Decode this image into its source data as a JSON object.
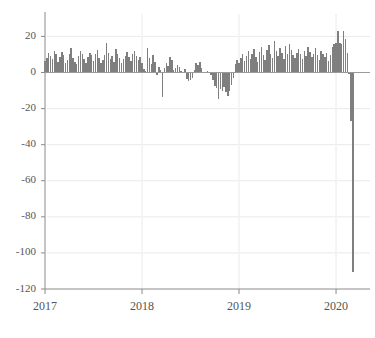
{
  "chart_data": {
    "type": "bar",
    "title": "",
    "subtitle": "",
    "xlabel": "",
    "ylabel": "",
    "xlim": [
      2017.0,
      2020.35
    ],
    "ylim": [
      -120,
      28
    ],
    "grid": true,
    "legend": null,
    "bar_color": "#7f7f7f",
    "x_tick_labels": [
      "2017",
      "2018",
      "2019",
      "2020"
    ],
    "x_tick_values": [
      2017,
      2018,
      2019,
      2020
    ],
    "y_tick_labels": [
      "20",
      "0",
      "-20",
      "-40",
      "-60",
      "-80",
      "-100",
      "-120"
    ],
    "y_tick_values": [
      20,
      0,
      -20,
      -40,
      -60,
      -80,
      -100,
      -120
    ],
    "x_start": 2017.0,
    "x_step": 0.019230769,
    "values": [
      6.5,
      8.0,
      11.0,
      9.0,
      7.5,
      12.0,
      10.0,
      6.0,
      8.5,
      11.5,
      9.5,
      5.5,
      7.0,
      10.5,
      13.5,
      8.0,
      6.0,
      4.5,
      9.0,
      12.0,
      10.0,
      7.5,
      5.0,
      8.5,
      11.0,
      9.5,
      6.5,
      10.0,
      12.5,
      8.0,
      5.5,
      7.0,
      9.5,
      16.5,
      11.0,
      7.5,
      9.0,
      6.0,
      13.0,
      10.5,
      8.0,
      5.5,
      7.5,
      9.0,
      11.5,
      8.5,
      6.5,
      10.0,
      12.0,
      9.0,
      7.0,
      8.5,
      5.0,
      2.0,
      0.8,
      13.5,
      8.0,
      4.5,
      9.5,
      6.0,
      -1.5,
      3.0,
      1.5,
      -13.5,
      2.5,
      5.0,
      3.5,
      8.5,
      7.0,
      1.5,
      2.5,
      4.0,
      3.0,
      1.0,
      -0.5,
      2.0,
      -3.5,
      -4.5,
      -4.0,
      -3.0,
      1.5,
      5.5,
      4.0,
      6.0,
      2.5,
      0.5,
      -0.5,
      1.0,
      0.5,
      -1.5,
      -4.0,
      -7.5,
      -8.5,
      -14.5,
      -9.0,
      -10.5,
      -8.0,
      -11.0,
      -13.0,
      -10.0,
      -7.0,
      -3.0,
      4.5,
      7.0,
      5.5,
      8.0,
      10.5,
      6.5,
      9.0,
      12.0,
      7.5,
      10.0,
      13.0,
      8.5,
      6.0,
      11.5,
      14.0,
      9.5,
      7.0,
      12.5,
      15.0,
      10.0,
      8.0,
      17.5,
      12.0,
      9.0,
      13.5,
      11.0,
      7.5,
      14.5,
      10.5,
      16.0,
      12.5,
      9.5,
      8.0,
      11.0,
      13.0,
      10.0,
      7.5,
      12.0,
      9.0,
      14.0,
      11.5,
      8.5,
      10.5,
      13.5,
      9.5,
      7.0,
      12.0,
      10.0,
      8.5,
      11.0,
      6.5,
      9.5,
      14.0,
      16.0,
      16.5,
      23.0,
      16.5,
      16.0,
      23.0,
      18.5,
      11.0,
      -1.0,
      -27.0,
      -110.5,
      -0.5
    ]
  }
}
